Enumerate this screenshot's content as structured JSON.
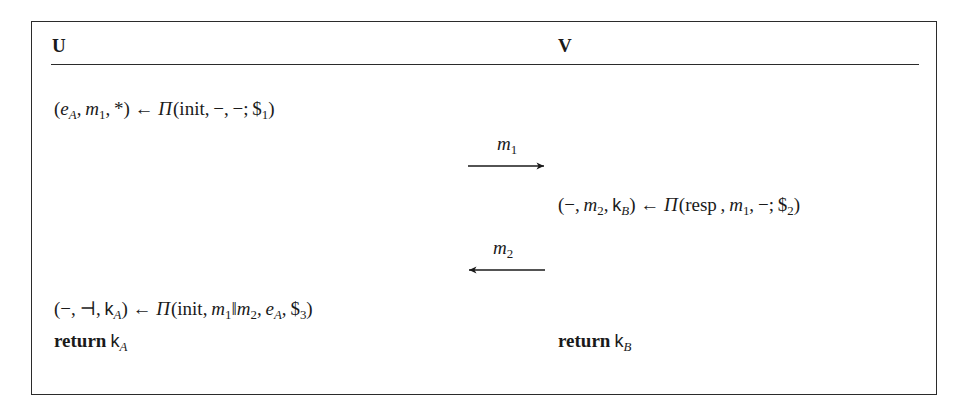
{
  "diagram": {
    "type": "protocol-message-sequence-chart",
    "parties": [
      {
        "id": "U",
        "label": "U",
        "side": "left"
      },
      {
        "id": "V",
        "label": "V",
        "side": "right"
      }
    ],
    "statements": [
      {
        "id": "u-init",
        "party": "U",
        "output_tuple": [
          "e_A",
          "m_1",
          "*"
        ],
        "assign": "←",
        "function": "Π",
        "args": [
          "init",
          "−",
          "−"
        ],
        "randomness": "$_1",
        "separator": ";",
        "text": "(e_A, m_1, *) ← Π(init, −, −; $_1)"
      },
      {
        "id": "v-resp",
        "party": "V",
        "output_tuple": [
          "−",
          "m_2",
          "k_B"
        ],
        "assign": "←",
        "function": "Π",
        "args": [
          "resp",
          "m_1",
          "−"
        ],
        "randomness": "$_2",
        "separator": ";",
        "text": "(−, m_2, k_B) ← Π(resp , m_1, −; $_2)"
      },
      {
        "id": "u-final",
        "party": "U",
        "output_tuple": [
          "−",
          "⊣",
          "k_A"
        ],
        "assign": "←",
        "function": "Π",
        "args": [
          "init",
          "m_1‖m_2",
          "e_A"
        ],
        "randomness": "$_3",
        "separator": ",",
        "text": "(−, ⊣, k_A) ← Π(init, m_1‖m_2, e_A, $_3)"
      }
    ],
    "messages": [
      {
        "id": "m1",
        "label": "m",
        "index": "1",
        "direction": "right",
        "from": "U",
        "to": "V"
      },
      {
        "id": "m2",
        "label": "m",
        "index": "2",
        "direction": "left",
        "from": "V",
        "to": "U"
      }
    ],
    "returns": [
      {
        "id": "return-u",
        "party": "U",
        "keyword": "return",
        "value": "k",
        "subscript": "A"
      },
      {
        "id": "return-v",
        "party": "V",
        "keyword": "return",
        "value": "k",
        "subscript": "B"
      }
    ],
    "tokens": {
      "open_paren": "(",
      "close_paren": ")",
      "comma": ",",
      "semicolon": ";",
      "dash": "−",
      "star": "*",
      "turnstile": "⊣",
      "parallel": "‖",
      "leftarrow": "←",
      "pi": "Π",
      "dollar": "$",
      "init": "init",
      "resp": "resp",
      "e": "e",
      "m": "m",
      "k": "k",
      "sub_A": "A",
      "sub_B": "B",
      "sub_1": "1",
      "sub_2": "2",
      "sub_3": "3"
    }
  },
  "colors": {
    "ink": "#1a1a1a",
    "rule": "#2b2b2b",
    "background": "#ffffff"
  }
}
